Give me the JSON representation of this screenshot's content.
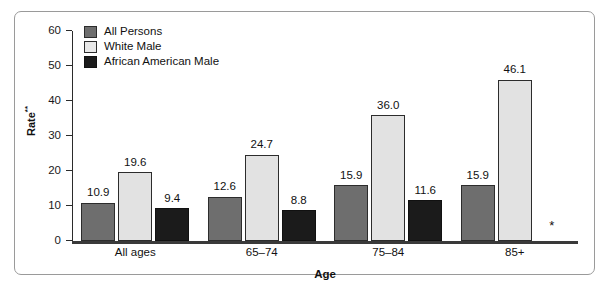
{
  "chart_data": {
    "type": "bar",
    "title": "",
    "xlabel": "Age",
    "ylabel": "Rate",
    "ylabel_superscript": "**",
    "ylim": [
      0,
      60
    ],
    "yticks": [
      0,
      10,
      20,
      30,
      40,
      50,
      60
    ],
    "grid": false,
    "legend_position": "top-left",
    "categories": [
      "All ages",
      "65–74",
      "75–84",
      "85+"
    ],
    "series": [
      {
        "name": "All Persons",
        "color": "#6e6e6e",
        "values": [
          10.9,
          12.6,
          15.9,
          15.9
        ],
        "labels": [
          "10.9",
          "12.6",
          "15.9",
          "15.9"
        ]
      },
      {
        "name": "White Male",
        "color": "#e2e2e2",
        "values": [
          19.6,
          24.7,
          36.0,
          46.1
        ],
        "labels": [
          "19.6",
          "24.7",
          "36.0",
          "46.1"
        ]
      },
      {
        "name": "African American Male",
        "color": "#1b1b1b",
        "values": [
          9.4,
          8.8,
          11.6,
          null
        ],
        "labels": [
          "9.4",
          "8.8",
          "11.6",
          "*"
        ]
      }
    ],
    "suppressed_marker": "*",
    "suppressed_note": "Value suppressed for African American Male, age 85+"
  },
  "axis": {
    "y_tick_labels": [
      "60",
      "50",
      "40",
      "30",
      "20",
      "10",
      "0"
    ],
    "y_title": "Rate",
    "y_title_superscript": "**",
    "x_title": "Age"
  },
  "legend": {
    "items": [
      {
        "label": "All Persons",
        "color": "#6e6e6e"
      },
      {
        "label": "White Male",
        "color": "#e8e8e8"
      },
      {
        "label": "African American Male",
        "color": "#1b1b1b"
      }
    ]
  },
  "groups": [
    {
      "label": "All ages",
      "bars": [
        {
          "series": "All Persons",
          "value": 10.9,
          "label": "10.9",
          "suppressed": false
        },
        {
          "series": "White Male",
          "value": 19.6,
          "label": "19.6",
          "suppressed": false
        },
        {
          "series": "African American Male",
          "value": 9.4,
          "label": "9.4",
          "suppressed": false
        }
      ]
    },
    {
      "label": "65–74",
      "bars": [
        {
          "series": "All Persons",
          "value": 12.6,
          "label": "12.6",
          "suppressed": false
        },
        {
          "series": "White Male",
          "value": 24.7,
          "label": "24.7",
          "suppressed": false
        },
        {
          "series": "African American Male",
          "value": 8.8,
          "label": "8.8",
          "suppressed": false
        }
      ]
    },
    {
      "label": "75–84",
      "bars": [
        {
          "series": "All Persons",
          "value": 15.9,
          "label": "15.9",
          "suppressed": false
        },
        {
          "series": "White Male",
          "value": 36.0,
          "label": "36.0",
          "suppressed": false
        },
        {
          "series": "African American Male",
          "value": 11.6,
          "label": "11.6",
          "suppressed": false
        }
      ]
    },
    {
      "label": "85+",
      "bars": [
        {
          "series": "All Persons",
          "value": 15.9,
          "label": "15.9",
          "suppressed": false
        },
        {
          "series": "White Male",
          "value": 46.1,
          "label": "46.1",
          "suppressed": false
        },
        {
          "series": "African American Male",
          "value": null,
          "label": "*",
          "suppressed": true
        }
      ]
    }
  ]
}
